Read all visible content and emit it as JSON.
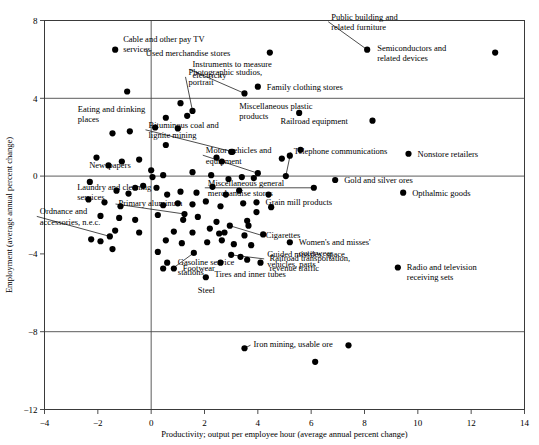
{
  "figure": {
    "name": "productivity-employment-scatter",
    "background": "#ffffff",
    "dot_color": "#000000",
    "axis_color": "#3a3a3a"
  },
  "chart_data": {
    "type": "scatter",
    "title": "",
    "xlabel": "Productivity; output per employee hour (average annual percent change)",
    "ylabel": "Employment (average annual percent change)",
    "xlim": [
      -4,
      14
    ],
    "ylim": [
      -12,
      8
    ],
    "xticks": [
      -4,
      -2,
      0,
      2,
      4,
      6,
      8,
      10,
      12,
      14
    ],
    "yticks": [
      8,
      4,
      0,
      -4,
      -8,
      -12
    ],
    "xticklabels": [
      "−4",
      "−2",
      "0",
      "2",
      "4",
      "6",
      "8",
      "10",
      "12",
      "14"
    ],
    "yticklabels": [
      "8",
      "4",
      "0",
      "−4",
      "−8",
      "−12"
    ],
    "grid": "horizontal gridlines at y = 4, 0, -8 and vertical gridline at x = 0",
    "gridlines_x": [
      0
    ],
    "gridlines_y": [
      4,
      0,
      -8
    ],
    "legend": "none",
    "labeled_points": [
      {
        "label": "Cable and other pay TV services",
        "x": -1.35,
        "y": 6.5,
        "lx": 8,
        "ly": -8,
        "anchor": "start",
        "leader": false
      },
      {
        "label": "Eating and drinking places",
        "x": 0.55,
        "y": 3.0,
        "lx": -88,
        "ly": -6,
        "anchor": "start",
        "leader": false
      },
      {
        "label": "Photographic studios, portrait",
        "x": 1.55,
        "y": 3.35,
        "lx": -4,
        "ly": -36,
        "anchor": "start",
        "leader": true
      },
      {
        "label": "Used merchandise stores",
        "x": 4.45,
        "y": 6.35,
        "lx": -124,
        "ly": 3,
        "anchor": "start",
        "leader": false
      },
      {
        "label": "Instruments to measure electricity",
        "x": 3.5,
        "y": 4.25,
        "lx": -52,
        "ly": -26,
        "anchor": "start",
        "leader": true
      },
      {
        "label": "Family clothing stores",
        "x": 4.0,
        "y": 4.6,
        "lx": 9,
        "ly": 3,
        "anchor": "start",
        "leader": false
      },
      {
        "label": "Public building and related furniture",
        "x": 8.1,
        "y": 6.5,
        "lx": -36,
        "ly": -30,
        "anchor": "start",
        "leader": true
      },
      {
        "label": "Semiconductors and related devices",
        "x": 12.9,
        "y": 6.35,
        "lx": -118,
        "ly": -2,
        "anchor": "start",
        "leader": false
      },
      {
        "label": "Miscellaneous plastic products",
        "x": 5.55,
        "y": 3.25,
        "lx": -60,
        "ly": -4,
        "anchor": "start",
        "leader": false
      },
      {
        "label": "Railroad equipment",
        "x": 8.3,
        "y": 2.85,
        "lx": -92,
        "ly": 3,
        "anchor": "start",
        "leader": false
      },
      {
        "label": "Bituminous coal and lignite mining",
        "x": 3.05,
        "y": 1.25,
        "lx": -84,
        "ly": -24,
        "anchor": "start",
        "leader": true
      },
      {
        "label": "Motor vehicles and equipment",
        "x": 4.0,
        "y": 0.15,
        "lx": -52,
        "ly": -20,
        "anchor": "start",
        "leader": true
      },
      {
        "label": "Telephone communications",
        "x": 5.05,
        "y": 0.0,
        "lx": 8,
        "ly": -22,
        "anchor": "start",
        "leader": true
      },
      {
        "label": "Nonstore retailers",
        "x": 9.65,
        "y": 1.15,
        "lx": 9,
        "ly": 3,
        "anchor": "start",
        "leader": false
      },
      {
        "label": "Newspapers",
        "x": 0.0,
        "y": 0.3,
        "lx": -62,
        "ly": -2,
        "anchor": "start",
        "leader": false
      },
      {
        "label": "Laundry and cleaning services",
        "x": -0.6,
        "y": -0.6,
        "lx": -58,
        "ly": 2,
        "anchor": "start",
        "leader": false
      },
      {
        "label": "Miscellaneous general merchandise stores",
        "x": 6.1,
        "y": -0.6,
        "lx": -106,
        "ly": -2,
        "anchor": "start",
        "leader": true
      },
      {
        "label": "Gold and silver ores",
        "x": 6.9,
        "y": -0.2,
        "lx": 9,
        "ly": 3,
        "anchor": "start",
        "leader": false
      },
      {
        "label": "Opthalmic goods",
        "x": 9.45,
        "y": -0.85,
        "lx": 9,
        "ly": 3,
        "anchor": "start",
        "leader": false
      },
      {
        "label": "Grain mill products",
        "x": 3.95,
        "y": -1.35,
        "lx": 9,
        "ly": 3,
        "anchor": "start",
        "leader": false
      },
      {
        "label": "Primary aluminum",
        "x": 1.25,
        "y": -1.95,
        "lx": -66,
        "ly": -8,
        "anchor": "start",
        "leader": true
      },
      {
        "label": "Ordnance and accessories, n.e.c.",
        "x": -1.55,
        "y": -3.1,
        "lx": -70,
        "ly": -22,
        "anchor": "start",
        "leader": true
      },
      {
        "label": "Cigarettes",
        "x": 2.95,
        "y": -2.55,
        "lx": 36,
        "ly": 12,
        "anchor": "start",
        "leader": true
      },
      {
        "label": "Women's and misses' outerwear",
        "x": 5.2,
        "y": -3.4,
        "lx": 9,
        "ly": 3,
        "anchor": "start",
        "leader": false
      },
      {
        "label": "Guided missiles, space vehicles, parts",
        "x": 3.0,
        "y": -4.05,
        "lx": 36,
        "ly": 2,
        "anchor": "start",
        "leader": true
      },
      {
        "label": "Gasoline service stations",
        "x": 1.6,
        "y": -3.95,
        "lx": -16,
        "ly": 12,
        "anchor": "start",
        "leader": true
      },
      {
        "label": "Railroad transportation, revenue traffic",
        "x": 4.1,
        "y": -4.45,
        "lx": 9,
        "ly": -2,
        "anchor": "start",
        "leader": false
      },
      {
        "label": "Radio and television receiving sets",
        "x": 9.25,
        "y": -4.7,
        "lx": 9,
        "ly": 2,
        "anchor": "start",
        "leader": false
      },
      {
        "label": "Footwear",
        "x": 0.85,
        "y": -4.75,
        "lx": 9,
        "ly": 3,
        "anchor": "start",
        "leader": false
      },
      {
        "label": "Tires and inner tubes",
        "x": 2.6,
        "y": -4.45,
        "lx": -6,
        "ly": 14,
        "anchor": "start",
        "leader": false
      },
      {
        "label": "Steel",
        "x": 2.05,
        "y": -5.2,
        "lx": -8,
        "ly": 16,
        "anchor": "start",
        "leader": false
      },
      {
        "label": "Iron mining, usable ore",
        "x": 3.5,
        "y": -8.85,
        "lx": 9,
        "ly": -1,
        "anchor": "start",
        "leader": true
      }
    ],
    "unlabeled_points": [
      {
        "x": -0.9,
        "y": 4.35
      },
      {
        "x": 1.1,
        "y": 3.75
      },
      {
        "x": 1.35,
        "y": 3.1
      },
      {
        "x": 0.15,
        "y": 2.5
      },
      {
        "x": 1.0,
        "y": 2.45
      },
      {
        "x": -0.8,
        "y": 2.3
      },
      {
        "x": -1.45,
        "y": 2.2
      },
      {
        "x": 0.55,
        "y": 1.6
      },
      {
        "x": 3.0,
        "y": 1.25
      },
      {
        "x": 2.45,
        "y": 0.95
      },
      {
        "x": 2.65,
        "y": 0.75
      },
      {
        "x": -2.05,
        "y": 0.95
      },
      {
        "x": -1.1,
        "y": 0.75
      },
      {
        "x": -1.6,
        "y": 0.55
      },
      {
        "x": -0.45,
        "y": 0.85
      },
      {
        "x": 5.2,
        "y": 1.05
      },
      {
        "x": 5.6,
        "y": 1.35
      },
      {
        "x": 4.9,
        "y": 0.9
      },
      {
        "x": 0.05,
        "y": -0.05
      },
      {
        "x": 0.45,
        "y": 0.05
      },
      {
        "x": 1.55,
        "y": 0.2
      },
      {
        "x": 2.25,
        "y": 0.05
      },
      {
        "x": 2.9,
        "y": -0.15
      },
      {
        "x": 3.4,
        "y": -0.05
      },
      {
        "x": 3.85,
        "y": -0.1
      },
      {
        "x": -2.3,
        "y": -0.3
      },
      {
        "x": -0.3,
        "y": -0.5
      },
      {
        "x": 0.2,
        "y": -0.6
      },
      {
        "x": -1.3,
        "y": -0.75
      },
      {
        "x": -0.85,
        "y": -0.9
      },
      {
        "x": 0.6,
        "y": -0.95
      },
      {
        "x": 1.1,
        "y": -0.8
      },
      {
        "x": 1.7,
        "y": -0.85
      },
      {
        "x": 2.3,
        "y": -0.55
      },
      {
        "x": 2.8,
        "y": -0.95
      },
      {
        "x": 3.3,
        "y": -0.75
      },
      {
        "x": 4.4,
        "y": -0.95
      },
      {
        "x": -2.35,
        "y": -1.2
      },
      {
        "x": -1.75,
        "y": -1.35
      },
      {
        "x": -1.15,
        "y": -1.55
      },
      {
        "x": 0.45,
        "y": -1.5
      },
      {
        "x": 1.0,
        "y": -1.4
      },
      {
        "x": 1.55,
        "y": -1.45
      },
      {
        "x": 2.05,
        "y": -1.3
      },
      {
        "x": 2.6,
        "y": -1.55
      },
      {
        "x": 3.45,
        "y": -1.4
      },
      {
        "x": 3.95,
        "y": -1.85
      },
      {
        "x": 4.5,
        "y": -1.6
      },
      {
        "x": -1.9,
        "y": -2.05
      },
      {
        "x": -1.2,
        "y": -2.15
      },
      {
        "x": -0.6,
        "y": -2.25
      },
      {
        "x": 0.25,
        "y": -2.0
      },
      {
        "x": 1.2,
        "y": -2.25
      },
      {
        "x": 1.75,
        "y": -2.1
      },
      {
        "x": 2.45,
        "y": -2.35
      },
      {
        "x": 3.6,
        "y": -2.3
      },
      {
        "x": 3.65,
        "y": -2.55
      },
      {
        "x": -1.35,
        "y": -2.8
      },
      {
        "x": -0.45,
        "y": -2.9
      },
      {
        "x": 0.85,
        "y": -2.85
      },
      {
        "x": 1.55,
        "y": -2.9
      },
      {
        "x": 2.2,
        "y": -2.7
      },
      {
        "x": 2.55,
        "y": -2.95
      },
      {
        "x": 2.75,
        "y": -2.9
      },
      {
        "x": 3.5,
        "y": -3.05
      },
      {
        "x": 4.2,
        "y": -3.0
      },
      {
        "x": -2.25,
        "y": -3.25
      },
      {
        "x": -1.9,
        "y": -3.35
      },
      {
        "x": 0.55,
        "y": -3.3
      },
      {
        "x": 1.15,
        "y": -3.45
      },
      {
        "x": 2.1,
        "y": -3.4
      },
      {
        "x": 2.65,
        "y": -3.3
      },
      {
        "x": 3.1,
        "y": -3.5
      },
      {
        "x": 3.75,
        "y": -3.55
      },
      {
        "x": -1.45,
        "y": -3.75
      },
      {
        "x": 0.25,
        "y": -3.9
      },
      {
        "x": 3.35,
        "y": -4.15
      },
      {
        "x": 3.6,
        "y": -4.3
      },
      {
        "x": 0.6,
        "y": -4.45
      },
      {
        "x": 0.45,
        "y": -4.75
      },
      {
        "x": 6.15,
        "y": -9.55
      },
      {
        "x": 7.4,
        "y": -8.7
      }
    ]
  },
  "footer": {
    "caption": ""
  }
}
